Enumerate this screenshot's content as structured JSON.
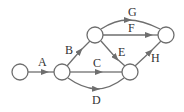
{
  "diagram": {
    "type": "directed-network",
    "colors": {
      "stroke": "#6e6e6e",
      "text": "#333333",
      "background": "#ffffff"
    },
    "nodes": [
      {
        "id": "n1",
        "x": 20,
        "y": 72
      },
      {
        "id": "n2",
        "x": 62,
        "y": 72
      },
      {
        "id": "n3",
        "x": 95,
        "y": 35
      },
      {
        "id": "n4",
        "x": 130,
        "y": 72
      },
      {
        "id": "n5",
        "x": 166,
        "y": 35
      }
    ],
    "edges": [
      {
        "label": "A",
        "from": "n1",
        "to": "n2"
      },
      {
        "label": "B",
        "from": "n2",
        "to": "n3"
      },
      {
        "label": "C",
        "from": "n2",
        "to": "n4"
      },
      {
        "label": "D",
        "from": "n2",
        "to": "n4",
        "curve": "below"
      },
      {
        "label": "E",
        "from": "n3",
        "to": "n4"
      },
      {
        "label": "F",
        "from": "n3",
        "to": "n5"
      },
      {
        "label": "G",
        "from": "n3",
        "to": "n5",
        "curve": "above"
      },
      {
        "label": "H",
        "from": "n4",
        "to": "n5"
      }
    ]
  }
}
